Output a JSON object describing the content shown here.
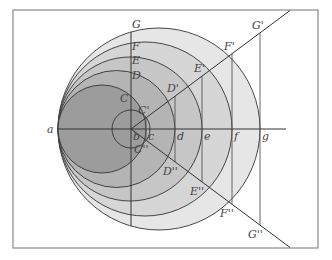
{
  "figure": {
    "frame": {
      "x": 13,
      "y": 10,
      "width": 305,
      "height": 238,
      "stroke": "#8a8a8a"
    },
    "axis": {
      "y": 129,
      "x_start": 58,
      "x_end": 286
    },
    "point_a": {
      "x": 58,
      "label": "a"
    },
    "circles": [
      {
        "name": "circle-g",
        "cx": 159,
        "r": 101,
        "fill": "#e6e6e6"
      },
      {
        "name": "circle-f",
        "cx": 145,
        "r": 87,
        "fill": "#d6d6d6"
      },
      {
        "name": "circle-e",
        "cx": 130,
        "r": 72,
        "fill": "#c6c6c6"
      },
      {
        "name": "circle-d",
        "cx": 116.5,
        "r": 58.5,
        "fill": "#b4b4b4"
      },
      {
        "name": "circle-c",
        "cx": 102,
        "r": 44,
        "fill": "#9c9c9c"
      }
    ],
    "small_circle": {
      "cx": 131,
      "r": 19
    },
    "foot_points": [
      {
        "x": 131,
        "label": "b"
      },
      {
        "x": 146,
        "label": "c"
      },
      {
        "x": 175,
        "label": "d"
      },
      {
        "x": 202,
        "label": "e"
      },
      {
        "x": 232,
        "label": "f"
      },
      {
        "x": 260,
        "label": "g"
      }
    ],
    "top_labels": [
      "G",
      "F",
      "E",
      "D",
      "C"
    ],
    "upper_ray_labels": [
      "C'",
      "D'",
      "E'",
      "F'",
      "G'"
    ],
    "lower_ray_labels": [
      "C''",
      "D''",
      "E''",
      "F''",
      "G''"
    ],
    "ray_end": {
      "x": 284,
      "dy": 114
    }
  }
}
